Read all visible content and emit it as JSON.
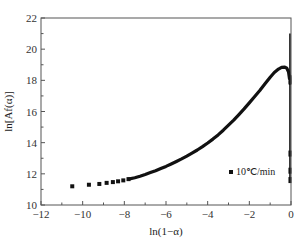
{
  "chart_data": {
    "type": "scatter",
    "title": "",
    "xlabel": "ln(1−α)",
    "ylabel": "ln[Af(α)]",
    "xlim": [
      -12,
      0
    ],
    "ylim": [
      10,
      22
    ],
    "xticks": [
      -12,
      -10,
      -8,
      -6,
      -4,
      -2,
      0
    ],
    "yticks": [
      10,
      12,
      14,
      16,
      18,
      20,
      22
    ],
    "xtick_labels": [
      "−12",
      "−10",
      "−8",
      "−6",
      "−4",
      "−2",
      "0"
    ],
    "ytick_labels": [
      "10",
      "12",
      "14",
      "16",
      "18",
      "20",
      "22"
    ],
    "grid": false,
    "legend_position": "lower right",
    "series": [
      {
        "name": "10℃/min",
        "marker": "square",
        "color": "#111111",
        "x": [
          -10.5,
          -9.7,
          -9.2,
          -8.85,
          -8.55,
          -8.3,
          -8.05,
          -7.8,
          -7.5,
          -7.25,
          -7.0,
          -6.75,
          -6.5,
          -6.25,
          -6.0,
          -5.75,
          -5.5,
          -5.25,
          -5.0,
          -4.75,
          -4.5,
          -4.25,
          -4.0,
          -3.75,
          -3.5,
          -3.25,
          -3.0,
          -2.75,
          -2.5,
          -2.25,
          -2.0,
          -1.75,
          -1.5,
          -1.25,
          -1.0,
          -0.8,
          -0.6,
          -0.45,
          -0.3,
          -0.2,
          -0.12,
          -0.07,
          -0.05,
          -0.05,
          -0.05,
          -0.05,
          -0.05,
          -0.05
        ],
        "y": [
          11.2,
          11.3,
          11.35,
          11.42,
          11.47,
          11.52,
          11.58,
          11.66,
          11.75,
          11.85,
          11.96,
          12.08,
          12.2,
          12.34,
          12.48,
          12.63,
          12.79,
          12.96,
          13.14,
          13.33,
          13.53,
          13.75,
          13.98,
          14.23,
          14.5,
          14.8,
          15.12,
          15.45,
          15.8,
          16.17,
          16.55,
          16.95,
          17.35,
          17.78,
          18.2,
          18.5,
          18.72,
          18.83,
          18.85,
          18.78,
          18.55,
          18.1,
          17.2,
          16.0,
          14.5,
          13.0,
          12.0,
          11.5
        ]
      }
    ],
    "annotations": [
      {
        "type": "vertical-segment",
        "x": -0.05,
        "y_from": 11.5,
        "y_to": 21.0
      }
    ]
  },
  "legend": {
    "label": "10℃/min"
  },
  "axes": {
    "xlabel": "ln(1−α)",
    "ylabel": "ln[Af(α)]"
  }
}
